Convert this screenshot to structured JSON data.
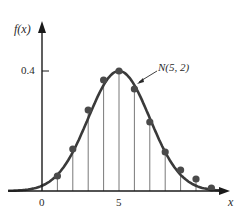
{
  "chart_data": {
    "type": "line",
    "title": "",
    "xlabel": "x",
    "ylabel": "f(x)",
    "x_ticks": [
      {
        "value": 0,
        "label": "0"
      },
      {
        "value": 5,
        "label": "5"
      }
    ],
    "y_ticks": [
      {
        "value": 0.4,
        "label": "0.4"
      }
    ],
    "xlim": [
      -2.5,
      12.5
    ],
    "ylim": [
      0,
      0.5
    ],
    "grid": false,
    "legend": null,
    "annotations": [
      {
        "text": "N(5, 2)",
        "points_to": "curve",
        "x": 6.5,
        "y": 0.31
      }
    ],
    "series": [
      {
        "name": "N(5, 2) density curve",
        "style": "smooth line",
        "mean": 5,
        "sd": 2
      },
      {
        "name": "Histogram-style sample points (stems)",
        "style": "points with vertical stems",
        "x": [
          1,
          2,
          3,
          4,
          5,
          6,
          7,
          8,
          9,
          10,
          11
        ],
        "values": [
          0.05,
          0.14,
          0.27,
          0.37,
          0.4,
          0.34,
          0.23,
          0.13,
          0.07,
          0.04,
          0.01
        ]
      }
    ]
  },
  "labels": {
    "y_axis": "f(x)",
    "x_axis": "x",
    "tick_0": "0",
    "tick_5": "5",
    "tick_04": "0.4",
    "annotation": "N(5, 2)"
  },
  "colors": {
    "curve": "#3a3a3a",
    "points": "#4a4a4a",
    "stems": "#6a6a6a",
    "axes": "#1a1a1a"
  }
}
